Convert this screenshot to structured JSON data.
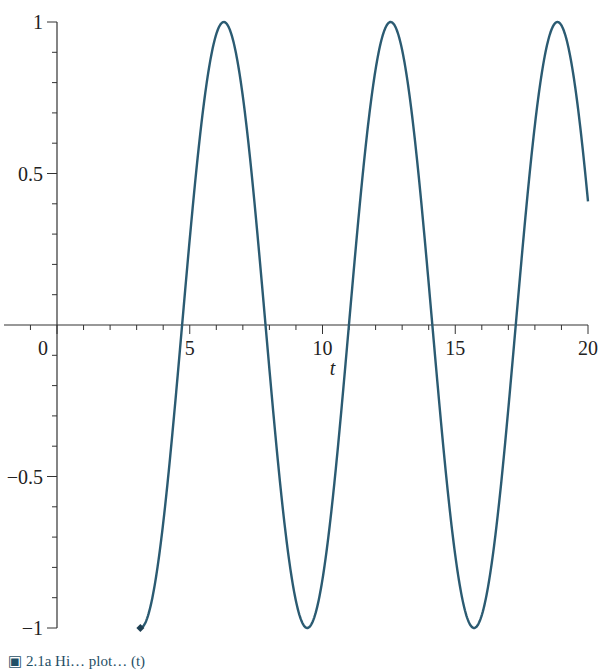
{
  "chart_data": {
    "type": "line",
    "title": "",
    "xlabel": "t",
    "ylabel": "",
    "function": "cos(t)",
    "x_range": [
      3.1416,
      20
    ],
    "xlim": [
      -1.6,
      20
    ],
    "ylim": [
      -1,
      1
    ],
    "x_ticks": [
      0,
      5,
      10,
      15,
      20
    ],
    "x_tick_labels": [
      "0",
      "5",
      "10",
      "15",
      "20"
    ],
    "y_ticks": [
      -1,
      -0.5,
      0.5,
      1
    ],
    "y_tick_labels": [
      "−1",
      "−0.5",
      "0.5",
      "1"
    ],
    "grid": false,
    "legend": null,
    "series": [
      {
        "name": "cos(t)",
        "color": "#2b5b72",
        "x": [
          3.14,
          4.71,
          6.28,
          7.85,
          9.42,
          11.0,
          12.57,
          14.14,
          15.71,
          17.28,
          18.85,
          20.0
        ],
        "values": [
          -1,
          0,
          1,
          0,
          -1,
          0,
          1,
          0,
          -1,
          0,
          1,
          0.41
        ]
      }
    ],
    "start_marker": {
      "x": 3.14,
      "y": -1,
      "shape": "diamond"
    }
  },
  "caption": {
    "text": "▣ 2.1a   Hi… plot… (t)"
  }
}
